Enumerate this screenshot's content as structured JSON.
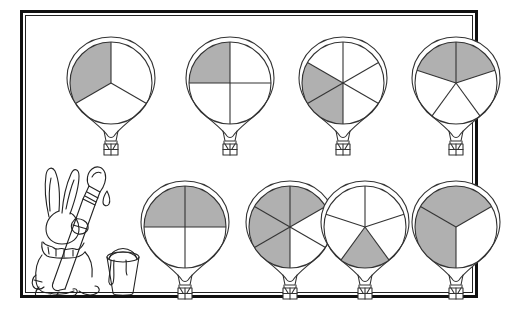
{
  "page": {
    "background_color": "#ffffff",
    "frame_color": "#111111",
    "shade_color": "#b0b0b0",
    "line_color": "#333333"
  },
  "illustration": {
    "name": "rabbit-painter",
    "description": "Rabbit seen from behind holding a large paintbrush with a paint drip, next to a paint bucket",
    "parts": [
      "rabbit",
      "long-ears",
      "fur-collar",
      "paintbrush",
      "paint-drip",
      "paint-bucket"
    ]
  },
  "balloons": [
    {
      "id": "balloon-1",
      "x": 33,
      "y": 18,
      "denominator": 3,
      "numerator": 1,
      "fraction_label": "1/3",
      "start_angle": -90,
      "shaded_sectors": [
        2
      ]
    },
    {
      "id": "balloon-2",
      "x": 152,
      "y": 18,
      "denominator": 4,
      "numerator": 1,
      "fraction_label": "1/4",
      "start_angle": -90,
      "shaded_sectors": [
        3
      ]
    },
    {
      "id": "balloon-3",
      "x": 265,
      "y": 18,
      "denominator": 6,
      "numerator": 2,
      "fraction_label": "2/6",
      "start_angle": -90,
      "shaded_sectors": [
        3,
        4
      ]
    },
    {
      "id": "balloon-4",
      "x": 378,
      "y": 18,
      "denominator": 5,
      "numerator": 2,
      "fraction_label": "2/5",
      "start_angle": -90,
      "shaded_sectors": [
        0,
        4
      ]
    },
    {
      "id": "balloon-5",
      "x": 107,
      "y": 162,
      "denominator": 4,
      "numerator": 2,
      "fraction_label": "2/4",
      "start_angle": -90,
      "shaded_sectors": [
        0,
        3
      ]
    },
    {
      "id": "balloon-6",
      "x": 212,
      "y": 162,
      "denominator": 6,
      "numerator": 4,
      "fraction_label": "4/6",
      "start_angle": -90,
      "shaded_sectors": [
        0,
        5,
        3,
        4
      ]
    },
    {
      "id": "balloon-7",
      "x": 287,
      "y": 162,
      "denominator": 5,
      "numerator": 1,
      "fraction_label": "1/5",
      "start_angle": -90,
      "shaded_sectors": [
        2
      ]
    },
    {
      "id": "balloon-8",
      "x": 378,
      "y": 162,
      "denominator": 3,
      "numerator": 2,
      "fraction_label": "2/3",
      "start_angle": -30,
      "shaded_sectors": [
        1,
        2
      ]
    }
  ]
}
